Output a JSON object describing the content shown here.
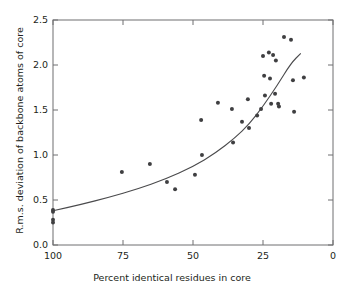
{
  "chart_data": {
    "type": "scatter",
    "title": "",
    "xlabel": "Percent identical residues in core",
    "ylabel": "R.m.s. deviation of backbone atoms of core",
    "xlim": [
      100,
      0
    ],
    "ylim": [
      0.0,
      2.5
    ],
    "x_reversed": true,
    "grid": false,
    "legend": null,
    "xticks": [
      100,
      75,
      50,
      25,
      0
    ],
    "xticklabels": [
      "100",
      "75",
      "50",
      "25",
      "0"
    ],
    "yticks": [
      0.0,
      0.5,
      1.0,
      1.5,
      2.0,
      2.5
    ],
    "yticklabels": [
      "0.0",
      "0.5",
      "1.0",
      "1.5",
      "2.0",
      "2.5"
    ],
    "marker_color": "#3f3f41",
    "marker_size": 4,
    "line_color": "#4a4a4c",
    "points": [
      {
        "x": 100.0,
        "y": 0.39
      },
      {
        "x": 100.0,
        "y": 0.37
      },
      {
        "x": 100.0,
        "y": 0.28
      },
      {
        "x": 100.0,
        "y": 0.25
      },
      {
        "x": 75.4,
        "y": 0.81
      },
      {
        "x": 65.4,
        "y": 0.9
      },
      {
        "x": 59.3,
        "y": 0.7
      },
      {
        "x": 56.4,
        "y": 0.62
      },
      {
        "x": 49.3,
        "y": 0.78
      },
      {
        "x": 47.1,
        "y": 1.39
      },
      {
        "x": 46.8,
        "y": 1.0
      },
      {
        "x": 41.1,
        "y": 1.58
      },
      {
        "x": 36.1,
        "y": 1.51
      },
      {
        "x": 35.7,
        "y": 1.14
      },
      {
        "x": 32.5,
        "y": 1.37
      },
      {
        "x": 30.4,
        "y": 1.62
      },
      {
        "x": 30.0,
        "y": 1.3
      },
      {
        "x": 27.1,
        "y": 1.44
      },
      {
        "x": 25.7,
        "y": 1.51
      },
      {
        "x": 25.0,
        "y": 2.1
      },
      {
        "x": 24.6,
        "y": 1.88
      },
      {
        "x": 24.3,
        "y": 1.66
      },
      {
        "x": 22.9,
        "y": 2.14
      },
      {
        "x": 22.5,
        "y": 1.85
      },
      {
        "x": 22.1,
        "y": 1.57
      },
      {
        "x": 21.4,
        "y": 2.11
      },
      {
        "x": 20.7,
        "y": 1.68
      },
      {
        "x": 20.4,
        "y": 2.05
      },
      {
        "x": 19.6,
        "y": 1.57
      },
      {
        "x": 19.3,
        "y": 1.54
      },
      {
        "x": 17.5,
        "y": 2.31
      },
      {
        "x": 15.0,
        "y": 2.28
      },
      {
        "x": 14.3,
        "y": 1.83
      },
      {
        "x": 13.9,
        "y": 1.48
      },
      {
        "x": 10.4,
        "y": 1.86
      }
    ],
    "fit_curve": {
      "description": "smooth increasing trend line",
      "points": [
        {
          "x": 100.0,
          "y": 0.38
        },
        {
          "x": 90.0,
          "y": 0.45
        },
        {
          "x": 80.0,
          "y": 0.53
        },
        {
          "x": 70.0,
          "y": 0.62
        },
        {
          "x": 60.0,
          "y": 0.73
        },
        {
          "x": 50.0,
          "y": 0.87
        },
        {
          "x": 42.0,
          "y": 1.02
        },
        {
          "x": 35.0,
          "y": 1.19
        },
        {
          "x": 30.0,
          "y": 1.34
        },
        {
          "x": 25.0,
          "y": 1.54
        },
        {
          "x": 20.0,
          "y": 1.77
        },
        {
          "x": 15.0,
          "y": 2.02
        },
        {
          "x": 11.5,
          "y": 2.13
        }
      ]
    }
  }
}
